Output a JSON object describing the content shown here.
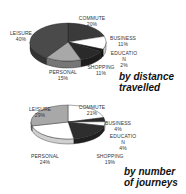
{
  "chart_data": [
    {
      "type": "pie",
      "title": "by distance travelled",
      "categories": [
        "COMMUTE",
        "BUSINESS",
        "EDUCATION",
        "SHOPPING",
        "PERSONAL",
        "LEISURE"
      ],
      "values": [
        20,
        11,
        2,
        11,
        15,
        40
      ],
      "labels": [
        {
          "name": "COMMUTE",
          "pct": "20%"
        },
        {
          "name": "BUSINESS",
          "pct": "11%"
        },
        {
          "name": "EDUCATIO",
          "name2": "N",
          "pct": "2%"
        },
        {
          "name": "SHOPPING",
          "pct": "11%"
        },
        {
          "name": "PERSONAL",
          "pct": "15%"
        },
        {
          "name": "LEISURE",
          "pct": "40%"
        }
      ],
      "caption_line1": "by distance",
      "caption_line2": "travelled",
      "style": "3d-pie"
    },
    {
      "type": "pie",
      "title": "by number of journeys",
      "categories": [
        "COMMUTE",
        "BUSINESS",
        "EDUCATION",
        "SHOPPING",
        "PERSONAL",
        "LEISURE"
      ],
      "values": [
        21,
        4,
        4,
        19,
        24,
        29
      ],
      "labels": [
        {
          "name": "COMMUTE",
          "pct": "21%"
        },
        {
          "name": "BUSINESS",
          "pct": "4%"
        },
        {
          "name": "EDUCATIO",
          "name2": "N",
          "pct": "4%"
        },
        {
          "name": "SHOPPING",
          "pct": "19%"
        },
        {
          "name": "PERSONAL",
          "pct": "24%"
        },
        {
          "name": "LEISURE",
          "pct": "29%"
        }
      ],
      "caption_line1": "by number",
      "caption_line2": "of journeys",
      "style": "3d-pie"
    }
  ],
  "colors": {
    "top": {
      "COMMUTE": "#3a3a3a",
      "BUSINESS": "#ffffff",
      "EDUCATION": "#1a1a1a",
      "SHOPPING": "#2a2a2a",
      "PERSONAL": "#a8a8a8",
      "LEISURE": "#4a4a4a"
    },
    "bottom": {
      "COMMUTE": "#ffffff",
      "BUSINESS": "#2a2a2a",
      "EDUCATION": "#ffffff",
      "SHOPPING": "#2e2e2e",
      "PERSONAL": "#ffffff",
      "LEISURE": "#a8a8a8"
    }
  }
}
